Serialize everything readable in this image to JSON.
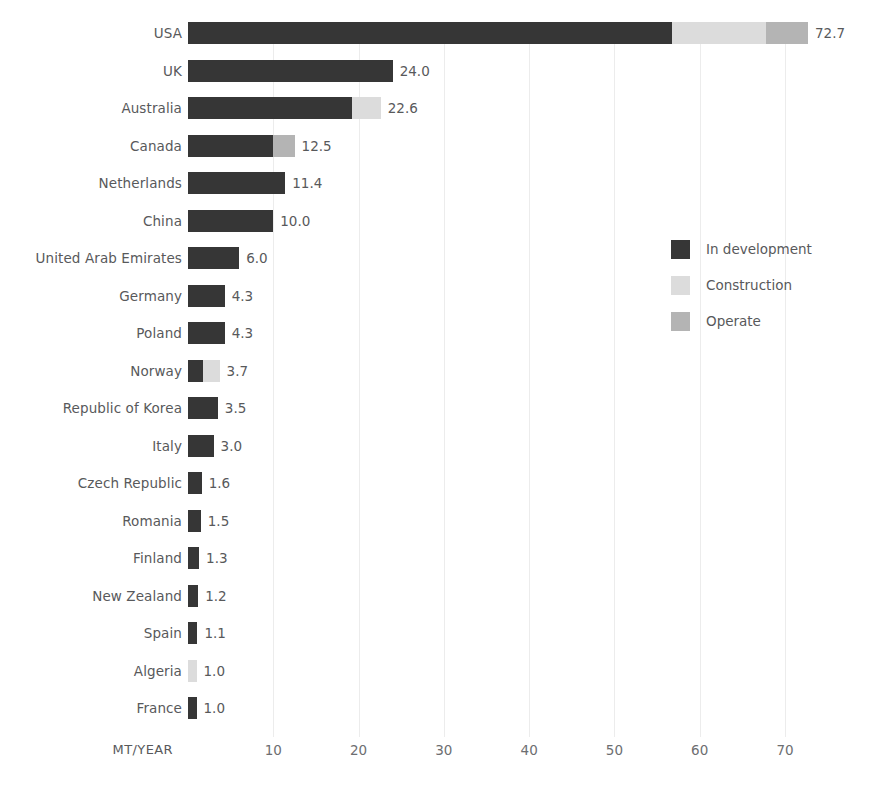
{
  "chart_data": {
    "type": "bar",
    "orientation": "horizontal",
    "stacked": true,
    "title": "",
    "xlabel": "MT/YEAR",
    "ylabel": "",
    "xlim": [
      0,
      75
    ],
    "xticks": [
      10,
      20,
      30,
      40,
      50,
      60,
      70
    ],
    "xtick_labels": [
      "10",
      "20",
      "30",
      "40",
      "50",
      "60",
      "70"
    ],
    "grid": "vertical-only",
    "legend_position": "middle-right",
    "categories": [
      "USA",
      "UK",
      "Australia",
      "Canada",
      "Netherlands",
      "China",
      "United Arab Emirates",
      "Germany",
      "Poland",
      "Norway",
      "Republic of Korea",
      "Italy",
      "Czech Republic",
      "Romania",
      "Finland",
      "New Zealand",
      "Spain",
      "Algeria",
      "France"
    ],
    "series": [
      {
        "name": "In development",
        "color": "#363636",
        "values": [
          56.8,
          24.0,
          19.2,
          10.0,
          11.4,
          10.0,
          6.0,
          4.3,
          4.3,
          1.8,
          3.5,
          3.0,
          1.6,
          1.5,
          1.3,
          1.2,
          1.1,
          0.0,
          1.0
        ]
      },
      {
        "name": "Construction",
        "color": "#dcdcdc",
        "values": [
          11.0,
          0.0,
          3.4,
          0.0,
          0.0,
          0.0,
          0.0,
          0.0,
          0.0,
          1.9,
          0.0,
          0.0,
          0.0,
          0.0,
          0.0,
          0.0,
          0.0,
          1.0,
          0.0
        ]
      },
      {
        "name": "Operate",
        "color": "#b4b4b4",
        "values": [
          4.9,
          0.0,
          0.0,
          2.5,
          0.0,
          0.0,
          0.0,
          0.0,
          0.0,
          0.0,
          0.0,
          0.0,
          0.0,
          0.0,
          0.0,
          0.0,
          0.0,
          0.0,
          0.0
        ]
      }
    ],
    "totals": [
      72.7,
      24.0,
      22.6,
      12.5,
      11.4,
      10.0,
      6.0,
      4.3,
      4.3,
      3.7,
      3.5,
      3.0,
      1.6,
      1.5,
      1.3,
      1.2,
      1.1,
      1.0,
      1.0
    ],
    "total_labels": [
      "72.7",
      "24.0",
      "22.6",
      "12.5",
      "11.4",
      "10.0",
      "6.0",
      "4.3",
      "4.3",
      "3.7",
      "3.5",
      "3.0",
      "1.6",
      "1.5",
      "1.3",
      "1.2",
      "1.1",
      "1.0",
      "1.0"
    ]
  },
  "legend": {
    "items": [
      {
        "label": "In development",
        "color": "#363636"
      },
      {
        "label": "Construction",
        "color": "#dcdcdc"
      },
      {
        "label": "Operate",
        "color": "#b4b4b4"
      }
    ]
  },
  "axis": {
    "title": "MT/YEAR"
  }
}
